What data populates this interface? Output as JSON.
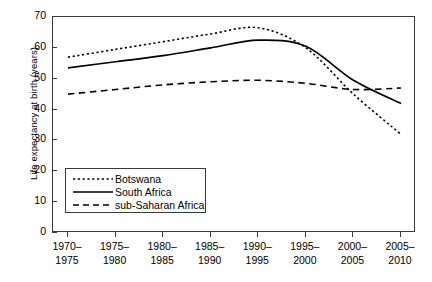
{
  "chart_data": {
    "type": "line",
    "title": "",
    "xlabel": "",
    "ylabel": "Life expectancy at birth (years)",
    "ylim": [
      0,
      70
    ],
    "yticks": [
      0,
      10,
      20,
      30,
      40,
      50,
      60,
      70
    ],
    "ytick_labels": [
      "0",
      "10",
      "20",
      "30",
      "40",
      "50",
      "60",
      "70"
    ],
    "grid": false,
    "legend_position": "lower-left-inside",
    "categories": [
      "1970-1975",
      "1975-1980",
      "1980-1985",
      "1985-1990",
      "1990-1995",
      "1995-2000",
      "2000-2005",
      "2005-2010"
    ],
    "tick_labels": [
      {
        "top": "1970–",
        "bottom": "1975"
      },
      {
        "top": "1975–",
        "bottom": "1980"
      },
      {
        "top": "1980–",
        "bottom": "1985"
      },
      {
        "top": "1985–",
        "bottom": "1990"
      },
      {
        "top": "1990–",
        "bottom": "1995"
      },
      {
        "top": "1995–",
        "bottom": "2000"
      },
      {
        "top": "2000–",
        "bottom": "2005"
      },
      {
        "top": "2005–",
        "bottom": "2010"
      }
    ],
    "series": [
      {
        "name": "Botswana",
        "style": "dotted",
        "color": "#000000",
        "values": [
          57.0,
          59.5,
          62.0,
          64.5,
          66.5,
          60.0,
          45.0,
          32.0
        ]
      },
      {
        "name": "South Africa",
        "style": "solid",
        "color": "#000000",
        "values": [
          53.5,
          55.5,
          57.5,
          60.0,
          62.5,
          60.5,
          49.5,
          42.0
        ]
      },
      {
        "name": "sub-Saharan Africa",
        "style": "dashed",
        "color": "#000000",
        "values": [
          45.0,
          46.5,
          48.0,
          49.0,
          49.5,
          48.5,
          46.5,
          47.0
        ]
      }
    ]
  },
  "legend": {
    "entries": [
      {
        "label": "Botswana",
        "style": "dotted"
      },
      {
        "label": "South Africa",
        "style": "solid"
      },
      {
        "label": "sub-Saharan Africa",
        "style": "dashed"
      }
    ]
  },
  "artefact": {
    "mark": "ˇ"
  }
}
